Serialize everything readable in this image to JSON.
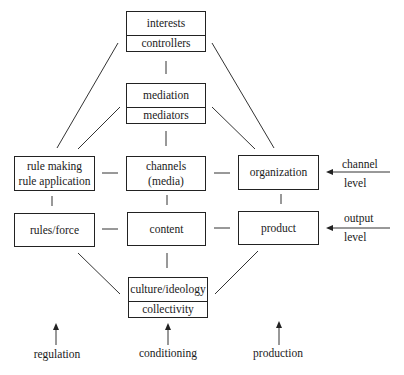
{
  "diagram": {
    "boxes": {
      "top": {
        "upper": "interests",
        "lower": "controllers"
      },
      "mediation": {
        "upper": "mediation",
        "lower": "mediators"
      },
      "rule_making": {
        "line1": "rule making",
        "line2": "rule application"
      },
      "channels": {
        "line1": "channels",
        "line2": "(media)"
      },
      "organization": {
        "label": "organization"
      },
      "rules_force": {
        "label": "rules/force"
      },
      "content": {
        "label": "content"
      },
      "product": {
        "label": "product"
      },
      "culture": {
        "upper": "culture/ideology",
        "lower": "collectivity"
      }
    },
    "side_labels": {
      "channel_level": {
        "line1": "channel",
        "line2": "level"
      },
      "output_level": {
        "line1": "output",
        "line2": "level"
      }
    },
    "bottom_labels": {
      "regulation": "regulation",
      "conditioning": "conditioning",
      "production": "production"
    },
    "colors": {
      "line": "#222222",
      "background": "#ffffff"
    }
  }
}
